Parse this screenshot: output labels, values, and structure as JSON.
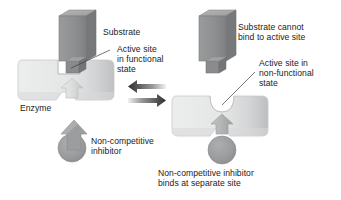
{
  "figure": {
    "type": "biology-diagram",
    "background_color": "#ffffff",
    "colors": {
      "substrate_front": "#8f9092",
      "substrate_top": "#a9aaac",
      "substrate_side": "#76787a",
      "enzyme_fill": "#e3e4e4",
      "enzyme_edge": "#c9cacb",
      "enzyme_shade": "#c4c5c6",
      "inhibitor_fill": "#9a9b9d",
      "inhibitor_dark": "#85868a",
      "arrow_dark": "#3a3a3a",
      "leader_line": "#444444",
      "text": "#222222"
    }
  },
  "panels": {
    "left": {
      "name": "functional-enzyme-panel",
      "labels": {
        "substrate": "Substrate",
        "active_site_line1": "Active site",
        "active_site_line2": "in functional",
        "active_site_line3": "state",
        "enzyme": "Enzyme",
        "inhibitor_line1": "Non-competitive",
        "inhibitor_line2": "inhibitor"
      }
    },
    "right": {
      "name": "inhibited-enzyme-panel",
      "labels": {
        "substrate_line1": "Substrate cannot",
        "substrate_line2": "bind to active site",
        "active_site_line1": "Active site in",
        "active_site_line2": "non-functional",
        "active_site_line3": "state",
        "inhibitor_line1": "Non-competitive inhibitor",
        "inhibitor_line2": "binds at separate site"
      }
    }
  },
  "arrows": {
    "reversible_left": "arrow-pointing-left",
    "reversible_right": "arrow-pointing-right"
  }
}
